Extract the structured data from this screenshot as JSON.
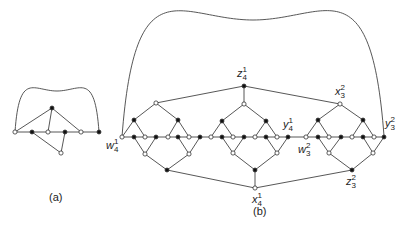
{
  "captions": {
    "a": "(a)",
    "b": "(b)"
  },
  "graph_a": {
    "nodes": [
      {
        "x": 15,
        "y": 132,
        "filled": false
      },
      {
        "x": 32,
        "y": 132,
        "filled": true
      },
      {
        "x": 48,
        "y": 132,
        "filled": false
      },
      {
        "x": 65,
        "y": 132,
        "filled": true
      },
      {
        "x": 81,
        "y": 132,
        "filled": false
      },
      {
        "x": 99,
        "y": 132,
        "filled": true
      },
      {
        "x": 52,
        "y": 108,
        "filled": true
      },
      {
        "x": 61,
        "y": 153,
        "filled": false
      }
    ],
    "edges": [
      [
        0,
        5
      ],
      [
        6,
        0
      ],
      [
        6,
        2
      ],
      [
        6,
        4
      ],
      [
        7,
        1
      ],
      [
        7,
        3
      ]
    ],
    "arc": {
      "x1": 15,
      "y1": 132,
      "x2": 99,
      "y2": 132,
      "top": 91
    }
  },
  "graph_b": {
    "labels": [
      {
        "id": "w4_1",
        "base": "w",
        "sub": "4",
        "sup": "1",
        "x": 106,
        "y": 138
      },
      {
        "id": "z4_1",
        "base": "z",
        "sub": "4",
        "sup": "1",
        "x": 237,
        "y": 66
      },
      {
        "id": "x3_2",
        "base": "x",
        "sub": "3",
        "sup": "2",
        "x": 335,
        "y": 84
      },
      {
        "id": "y4_1",
        "base": "y",
        "sub": "4",
        "sup": "1",
        "x": 283,
        "y": 117
      },
      {
        "id": "y3_2",
        "base": "y",
        "sub": "3",
        "sup": "2",
        "x": 385,
        "y": 116
      },
      {
        "id": "w3_2",
        "base": "w",
        "sub": "3",
        "sup": "2",
        "x": 298,
        "y": 142
      },
      {
        "id": "x4_1",
        "base": "x",
        "sub": "4",
        "sup": "1",
        "x": 252,
        "y": 192
      },
      {
        "id": "z3_2",
        "base": "z",
        "sub": "3",
        "sup": "2",
        "x": 346,
        "y": 174
      }
    ],
    "arc": {
      "x1": 122,
      "y1": 137,
      "x2": 384,
      "y2": 136,
      "top": 20
    },
    "baseline": {
      "x1": 122,
      "x2": 384,
      "y": 137
    }
  }
}
